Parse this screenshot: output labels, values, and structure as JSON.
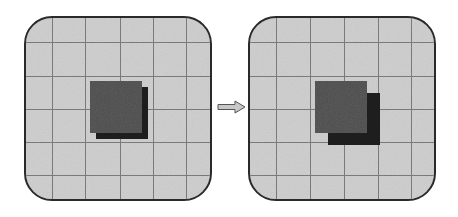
{
  "diagram": {
    "type": "before-after-transformation",
    "panels": [
      {
        "id": "before",
        "grid": {
          "columns": 6,
          "rows": 6
        },
        "front_square": {
          "x": 90,
          "y": 81,
          "size": 52,
          "color": "#4a4a4a"
        },
        "shadow_square": {
          "offset_x": 6,
          "offset_y": 6,
          "size": 52,
          "color": "#1e1e1e"
        }
      },
      {
        "id": "after",
        "grid": {
          "columns": 6,
          "rows": 6
        },
        "front_square": {
          "x": 315,
          "y": 81,
          "size": 52,
          "color": "#4a4a4a"
        },
        "shadow_square": {
          "offset_x": 13,
          "offset_y": 12,
          "size": 52,
          "color": "#1e1e1e"
        }
      }
    ],
    "arrow": {
      "direction": "right",
      "color": "#c8c8c8",
      "outline": "#555555"
    },
    "colors": {
      "panel_background": "#d2d2d2",
      "panel_border": "#2a2a2a",
      "grid_lines": "#7a7a7a"
    }
  }
}
